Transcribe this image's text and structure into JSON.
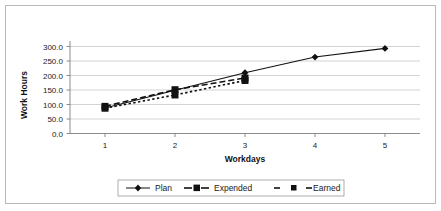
{
  "chart_data": {
    "type": "line",
    "title": "",
    "xlabel": "Workdays",
    "ylabel": "Work Hours",
    "x": [
      1,
      2,
      3,
      4,
      5
    ],
    "xtick_labels": [
      "1",
      "2",
      "3",
      "4",
      "5"
    ],
    "ytick_labels": [
      "0.0",
      "50.0",
      "100.0",
      "150.0",
      "200.0",
      "250.0",
      "300.0"
    ],
    "ytick_values": [
      0,
      50,
      100,
      150,
      200,
      250,
      300
    ],
    "ylim": [
      0,
      300
    ],
    "xlim": [
      0.5,
      5.5
    ],
    "grid": "horizontal",
    "legend_position": "bottom",
    "series": [
      {
        "name": "Plan",
        "marker": "diamond",
        "line_style": "solid",
        "x": [
          1,
          2,
          3,
          4,
          5
        ],
        "values": [
          83,
          140,
          197,
          248,
          276
        ]
      },
      {
        "name": "Expended",
        "marker": "square",
        "line_style": "dashed",
        "x": [
          1,
          2,
          3
        ],
        "values": [
          88,
          142,
          180
        ]
      },
      {
        "name": "Earned",
        "marker": "square",
        "line_style": "dotted",
        "x": [
          1,
          2,
          3
        ],
        "values": [
          82,
          125,
          172
        ]
      }
    ]
  },
  "axes": {
    "y_title": "Work Hours",
    "x_title": "Workdays"
  },
  "legend": {
    "entries": [
      {
        "label": "Plan"
      },
      {
        "label": "Expended"
      },
      {
        "label": "Earned"
      }
    ]
  },
  "colors": {
    "line": "#111111",
    "grid": "#c8c8c8",
    "axis": "#808080",
    "border": "#b9b9b9",
    "background": "#ffffff"
  }
}
